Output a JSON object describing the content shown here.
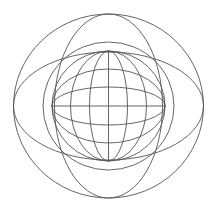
{
  "figure": {
    "background": "#ffffff",
    "stroke_color": "#555555",
    "center": {
      "x": 108.5,
      "y": 106
    },
    "outer_circle": {
      "rx": 95,
      "ry": 92
    },
    "horizontal_ellipse": {
      "rx": 95,
      "ry": 54
    },
    "vertical_ellipse": {
      "rx": 54,
      "ry": 92
    },
    "ring_circle": {
      "rx": 65.5,
      "ry": 64
    },
    "sphere": {
      "rx": 56.5,
      "ry": 55
    },
    "meridians_rx": [
      38,
      19
    ],
    "parallels_ry": [
      37,
      19
    ]
  }
}
